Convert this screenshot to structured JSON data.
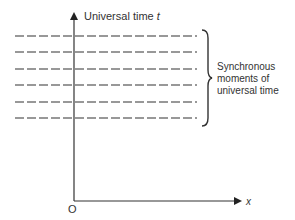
{
  "diagram": {
    "y_axis_label": "Universal time ",
    "y_axis_var": "t",
    "x_axis_label": "x",
    "origin_label": "O",
    "brace_label_lines": [
      "Synchronous",
      "moments of",
      "universal time"
    ],
    "line_count": 6,
    "line_y": [
      36,
      52,
      69,
      85,
      102,
      118
    ],
    "colors": {
      "stroke": "#333333",
      "text": "#333333"
    }
  }
}
